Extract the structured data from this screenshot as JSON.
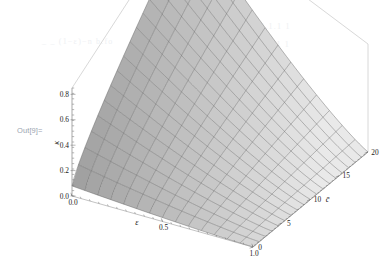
{
  "notebook": {
    "out_label": "Out[9]=",
    "ghost_text_1": "_ _ (1−ε)−n    b.fo",
    "ghost_text_2": "1 1;  1.1.1  1",
    "ghost_text_3": "1  .1 . 1  1"
  },
  "colors": {
    "surface_dark": "#8e8e8e",
    "surface_light": "#e9e9e9",
    "mesh": "#5b5b5b",
    "axis": "#9a9a9a",
    "box": "#b8b8b8",
    "text": "#1a1a1a",
    "out_label": "#9aa4b0",
    "background": "#ffffff"
  },
  "chart_data": {
    "type": "surface",
    "title": "",
    "xlabel": "ε",
    "ylabel": "c̄",
    "zlabel": "κ",
    "xlim": [
      0.0,
      1.0
    ],
    "ylim": [
      0,
      20
    ],
    "zlim": [
      0.0,
      0.85
    ],
    "grid": true,
    "legend": "none",
    "projection": "3d-wireframe-shaded",
    "x_ticks": [
      {
        "value": 0.0,
        "label": "0.0"
      },
      {
        "value": 0.5,
        "label": "0.5"
      },
      {
        "value": 1.0,
        "label": "1.0"
      }
    ],
    "y_ticks": [
      {
        "value": 0,
        "label": "0"
      },
      {
        "value": 5,
        "label": "5"
      },
      {
        "value": 10,
        "label": "10"
      },
      {
        "value": 15,
        "label": "15"
      },
      {
        "value": 20,
        "label": "20"
      }
    ],
    "z_ticks": [
      {
        "value": 0.0,
        "label": "0.0"
      },
      {
        "value": 0.2,
        "label": "0.2"
      },
      {
        "value": 0.4,
        "label": "0.4"
      },
      {
        "value": 0.6,
        "label": "0.6"
      },
      {
        "value": 0.8,
        "label": "0.8"
      }
    ],
    "z_minor_tick_count": 20,
    "surface_description": "Monotone decreasing sheet: kappa is highest (near 0.85) at small epsilon and large c-bar, falling toward 0 as epsilon approaches 1.",
    "mesh_grid": {
      "nx": 14,
      "ny": 18
    },
    "z_values_at_corners": {
      "eps0_c0": 0.0,
      "eps0_c20": 0.85,
      "eps1_c0": 0.0,
      "eps1_c20": 0.12
    },
    "shading": "grayscale, darker at low epsilon edge, lighter toward high c-bar"
  }
}
